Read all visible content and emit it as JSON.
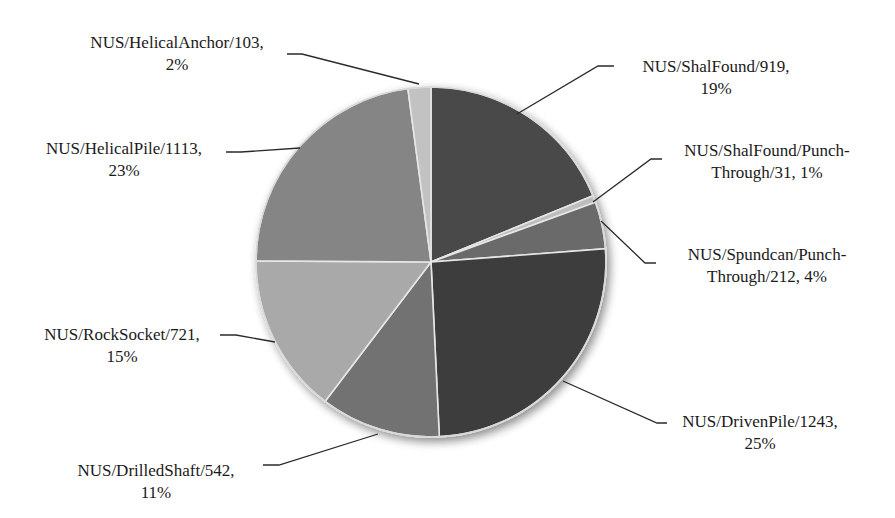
{
  "chart_data": {
    "type": "pie",
    "title": "",
    "start_angle_deg": 0,
    "direction": "clockwise",
    "legend": "none",
    "label_format": "{name}/{value}, {percent}",
    "slices": [
      {
        "name": "NUS/ShalFound",
        "value": 919,
        "percent": "19%",
        "color": "#4a4a4a",
        "label_line1": "NUS/ShalFound/919,",
        "label_line2": "19%"
      },
      {
        "name": "NUS/ShalFound/Punch-Through",
        "value": 31,
        "percent": "1%",
        "color": "#bdbdbd",
        "label_line1": "NUS/ShalFound/Punch-",
        "label_line2": "Through/31, 1%"
      },
      {
        "name": "NUS/Spundcan/Punch-Through",
        "value": 212,
        "percent": "4%",
        "color": "#6a6a6a",
        "label_line1": "NUS/Spundcan/Punch-",
        "label_line2": "Through/212, 4%"
      },
      {
        "name": "NUS/DrivenPile",
        "value": 1243,
        "percent": "25%",
        "color": "#3e3e3e",
        "label_line1": "NUS/DrivenPile/1243,",
        "label_line2": "25%"
      },
      {
        "name": "NUS/DrilledShaft",
        "value": 542,
        "percent": "11%",
        "color": "#727272",
        "label_line1": "NUS/DrilledShaft/542,",
        "label_line2": "11%"
      },
      {
        "name": "NUS/RockSocket",
        "value": 721,
        "percent": "15%",
        "color": "#a9a9a9",
        "label_line1": "NUS/RockSocket/721,",
        "label_line2": "15%"
      },
      {
        "name": "NUS/HelicalPile",
        "value": 1113,
        "percent": "23%",
        "color": "#858585",
        "label_line1": "NUS/HelicalPile/1113,",
        "label_line2": "23%"
      },
      {
        "name": "NUS/HelicalAnchor",
        "value": 103,
        "percent": "2%",
        "color": "#c2c2c2",
        "label_line1": "NUS/HelicalAnchor/103,",
        "label_line2": "2%"
      }
    ]
  }
}
